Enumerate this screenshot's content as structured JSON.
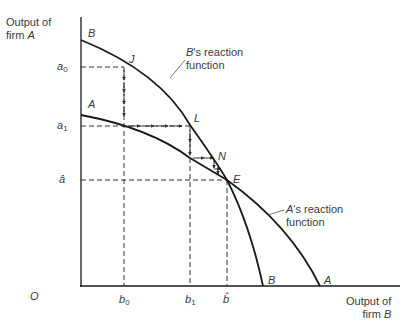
{
  "axes": {
    "y_label_line1": "Output of",
    "y_label_line2_prefix": "firm ",
    "y_label_line2_var": "A",
    "x_label_line1": "Output of",
    "x_label_line2_prefix": "firm ",
    "x_label_line2_var": "B",
    "origin": "O"
  },
  "y_ticks": [
    {
      "base": "a",
      "sub": "0"
    },
    {
      "base": "a",
      "sub": "1"
    },
    {
      "base": "â",
      "sub": ""
    }
  ],
  "x_ticks": [
    {
      "base": "b",
      "sub": "0"
    },
    {
      "base": "b",
      "sub": "1"
    },
    {
      "base": "b̂",
      "sub": ""
    }
  ],
  "curves": {
    "b_reaction": {
      "start_label": "B",
      "end_label": "B",
      "annotation_var": "B",
      "annotation_rest": "'s reaction",
      "annotation_line2": "function"
    },
    "a_reaction": {
      "start_label": "A",
      "end_label": "A",
      "annotation_var": "A",
      "annotation_rest": "'s reaction",
      "annotation_line2": "function"
    }
  },
  "points": {
    "J": "J",
    "L": "L",
    "N": "N",
    "E": "E"
  },
  "colors": {
    "line": "#1a1a1a",
    "dashed": "#333333",
    "text": "#3a3a3a"
  }
}
